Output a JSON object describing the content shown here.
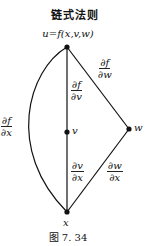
{
  "title": "链式法则",
  "formula": "u=f(x,v,w)",
  "nodes": {
    "v": "v",
    "w": "w",
    "x": "x"
  },
  "edges": {
    "u_x": {
      "num": "∂f",
      "den": "∂x"
    },
    "u_v": {
      "num": "∂f",
      "den": "∂v"
    },
    "u_w": {
      "num": "∂f",
      "den": "∂w"
    },
    "v_x": {
      "num": "∂v",
      "den": "∂x"
    },
    "w_x": {
      "num": "∂w",
      "den": "∂x"
    }
  },
  "caption": "图 7. 34"
}
